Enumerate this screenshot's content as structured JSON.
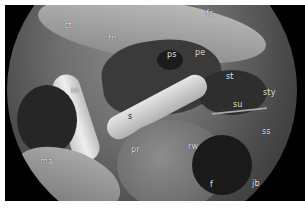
{
  "image": {
    "description": "Grayscale endoscopic view of middle ear / temporal bone anatomy with anatomical labels",
    "labels": [
      {
        "id": "ct",
        "text": "ct",
        "x": 64,
        "y": 26
      },
      {
        "id": "fn",
        "text": "fn",
        "x": 108,
        "y": 38
      },
      {
        "id": "fs",
        "text": "fs",
        "x": 206,
        "y": 12
      },
      {
        "id": "ps",
        "text": "ps",
        "x": 168,
        "y": 53
      },
      {
        "id": "pe",
        "text": "pe",
        "x": 195,
        "y": 52
      },
      {
        "id": "st",
        "text": "st",
        "x": 225,
        "y": 76
      },
      {
        "id": "sty",
        "text": "sty",
        "x": 262,
        "y": 92
      },
      {
        "id": "in",
        "text": "in",
        "x": 70,
        "y": 90
      },
      {
        "id": "su",
        "text": "su",
        "x": 233,
        "y": 103
      },
      {
        "id": "s",
        "text": "s",
        "x": 128,
        "y": 116
      },
      {
        "id": "ss",
        "text": "ss",
        "x": 262,
        "y": 130
      },
      {
        "id": "pr",
        "text": "pr",
        "x": 131,
        "y": 148
      },
      {
        "id": "rw",
        "text": "rw",
        "x": 188,
        "y": 145
      },
      {
        "id": "ma",
        "text": "ma",
        "x": 40,
        "y": 160
      },
      {
        "id": "f",
        "text": "f",
        "x": 209,
        "y": 183
      },
      {
        "id": "jb",
        "text": "jb",
        "x": 252,
        "y": 182
      }
    ]
  }
}
